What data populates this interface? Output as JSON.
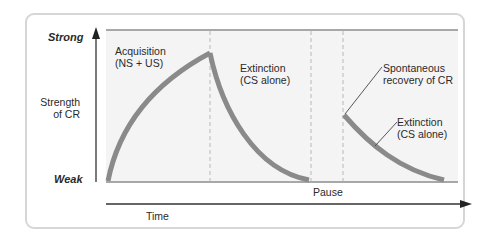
{
  "diagram": {
    "y_axis": {
      "top_label": "Strong",
      "bottom_label": "Weak",
      "title_line1": "Strength",
      "title_line2": "of CR"
    },
    "x_axis": {
      "label": "Time"
    },
    "phases": [
      {
        "name": "acquisition",
        "line1": "Acquisition",
        "line2": "(NS + US)"
      },
      {
        "name": "extinction-1",
        "line1": "Extinction",
        "line2": "(CS alone)"
      },
      {
        "name": "pause",
        "line1": "Pause"
      },
      {
        "name": "spontaneous-recovery",
        "line1": "Spontaneous",
        "line2": "recovery of CR"
      },
      {
        "name": "extinction-2",
        "line1": "Extinction",
        "line2": "(CS alone)"
      }
    ],
    "colors": {
      "curve": "#8a8a8a",
      "plot_bg": "#f4f4f4",
      "axis": "#333333",
      "border": "#d6d6d6",
      "dashed": "#b8b8b8"
    }
  }
}
